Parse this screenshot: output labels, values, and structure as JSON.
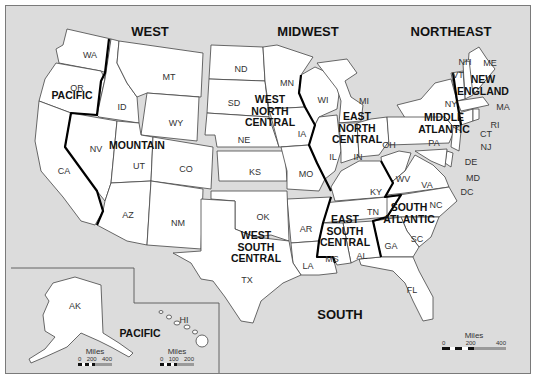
{
  "regions": {
    "west": "WEST",
    "midwest": "MIDWEST",
    "northeast": "NORTHEAST",
    "south": "SOUTH"
  },
  "divisions": {
    "pacific": "PACIFIC",
    "mountain": "MOUNTAIN",
    "west_north_central": "WEST\nNORTH\nCENTRAL",
    "east_north_central": "EAST\nNORTH\nCENTRAL",
    "new_england": "NEW\nENGLAND",
    "middle_atlantic": "MIDDLE\nATLANTIC",
    "west_south_central": "WEST\nSOUTH\nCENTRAL",
    "east_south_central": "EAST\nSOUTH\nCENTRAL",
    "south_atlantic": "SOUTH\nATLANTIC",
    "pacific_inset": "PACIFIC"
  },
  "states": {
    "WA": "WA",
    "OR": "OR",
    "CA": "CA",
    "ID": "ID",
    "NV": "NV",
    "MT": "MT",
    "WY": "WY",
    "UT": "UT",
    "CO": "CO",
    "AZ": "AZ",
    "NM": "NM",
    "ND": "ND",
    "SD": "SD",
    "NE": "NE",
    "KS": "KS",
    "MN": "MN",
    "IA": "IA",
    "MO": "MO",
    "WI": "WI",
    "MI": "MI",
    "IL": "IL",
    "IN": "IN",
    "OH": "OH",
    "ME": "ME",
    "NH": "NH",
    "VT": "VT",
    "MA": "MA",
    "RI": "RI",
    "CT": "CT",
    "NY": "NY",
    "PA": "PA",
    "NJ": "NJ",
    "DE": "DE",
    "MD": "MD",
    "DC": "DC",
    "VA": "VA",
    "WV": "WV",
    "NC": "NC",
    "SC": "SC",
    "GA": "GA",
    "FL": "FL",
    "KY": "KY",
    "TN": "TN",
    "MS": "MS",
    "AL": "AL",
    "OK": "OK",
    "TX": "TX",
    "AR": "AR",
    "LA": "LA",
    "AK": "AK",
    "HI": "HI"
  },
  "scales": {
    "alaska": {
      "title": "Miles",
      "ticks": [
        "0",
        "200",
        "400"
      ]
    },
    "hawaii": {
      "title": "Miles",
      "ticks": [
        "0",
        "100",
        "200"
      ]
    },
    "mainland": {
      "title": "Miles",
      "ticks": [
        "0",
        "200",
        "400"
      ]
    }
  },
  "colors": {
    "background": "#dcdcdc",
    "state_fill": "#ffffff",
    "state_border": "#444444",
    "division_border": "#000000"
  }
}
